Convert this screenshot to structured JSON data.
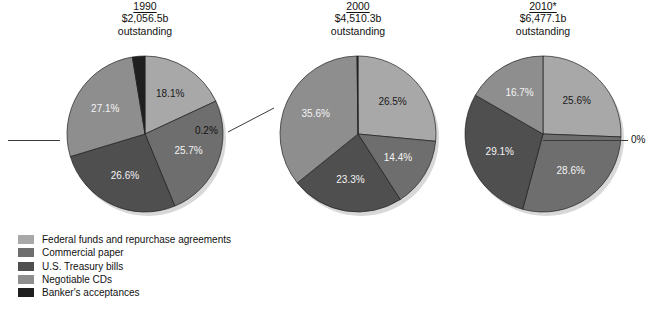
{
  "clipped_top_text": "",
  "legend": {
    "items": [
      {
        "label": "Federal funds and repurchase agreements",
        "color": "#a8a8a8"
      },
      {
        "label": "Commercial paper",
        "color": "#6e6e6e"
      },
      {
        "label": "U.S. Treasury bills",
        "color": "#4f4f4f"
      },
      {
        "label": "Negotiable CDs",
        "color": "#8e8e8e"
      },
      {
        "label": "Banker's acceptances",
        "color": "#1f1f1f"
      }
    ]
  },
  "panels": [
    {
      "year": "1990",
      "amount": "$2,056.5b",
      "subtitle": "outstanding",
      "callout": {
        "text": "2.6%",
        "side": "left"
      }
    },
    {
      "year": "2000",
      "amount": "$4,510.3b",
      "subtitle": "outstanding",
      "callout": {
        "text": "0.2%",
        "side": "left"
      }
    },
    {
      "year": "2010*",
      "amount": "$6,477.1b",
      "subtitle": "outstanding",
      "callout": {
        "text": "0%",
        "side": "right"
      }
    }
  ],
  "chart_data": {
    "type": "pie",
    "xlabel": "",
    "ylabel": "",
    "legend_position": "bottom-left",
    "grid": false,
    "value_unit": "percent",
    "categories": [
      "Federal funds and repurchase agreements",
      "Commercial paper",
      "U.S. Treasury bills",
      "Negotiable CDs",
      "Banker's acceptances"
    ],
    "colors": [
      "#a8a8a8",
      "#6e6e6e",
      "#4f4f4f",
      "#8e8e8e",
      "#1f1f1f"
    ],
    "series": [
      {
        "name": "1990",
        "total_label": "$2,056.5b outstanding",
        "total_value": 2056.5,
        "values": [
          18.1,
          25.7,
          26.6,
          27.1,
          2.6
        ],
        "labels": [
          "18.1%",
          "25.7%",
          "26.6%",
          "27.1%",
          "2.6%"
        ]
      },
      {
        "name": "2000",
        "total_label": "$4,510.3b outstanding",
        "total_value": 4510.3,
        "values": [
          26.5,
          14.4,
          23.3,
          35.6,
          0.2
        ],
        "labels": [
          "26.5%",
          "14.4%",
          "23.3%",
          "35.6%",
          "0.2%"
        ]
      },
      {
        "name": "2010*",
        "total_label": "$6,477.1b outstanding",
        "total_value": 6477.1,
        "values": [
          25.6,
          28.6,
          29.1,
          16.7,
          0.0
        ],
        "labels": [
          "25.6%",
          "28.6%",
          "29.1%",
          "16.7%",
          "0%"
        ]
      }
    ]
  }
}
